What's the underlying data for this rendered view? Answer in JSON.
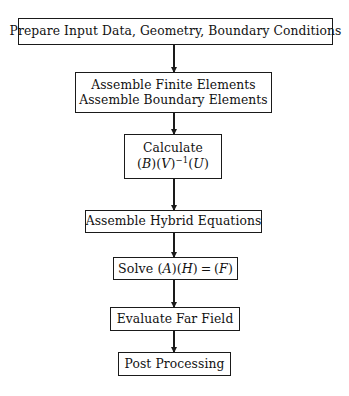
{
  "diagram": {
    "type": "flowchart",
    "orientation": "top-to-bottom",
    "background_color": "#ffffff",
    "line_color": "#1a1a1a",
    "nodes": [
      {
        "id": "prepare",
        "shape": "rectangle",
        "lines": [
          "Prepare Input Data, Geometry, Boundary Conditions"
        ]
      },
      {
        "id": "assemble-elements",
        "shape": "rectangle",
        "lines": [
          "Assemble Finite Elements",
          "Assemble Boundary Elements"
        ]
      },
      {
        "id": "calculate",
        "shape": "rectangle",
        "lines": [
          "Calculate"
        ],
        "formula": {
          "text": "(B)(V)^-1(U)",
          "parts": [
            {
              "kind": "paren",
              "text": "("
            },
            {
              "kind": "var",
              "text": "B"
            },
            {
              "kind": "paren",
              "text": ")("
            },
            {
              "kind": "var",
              "text": "V"
            },
            {
              "kind": "paren",
              "text": ")"
            },
            {
              "kind": "sup",
              "text": "−1"
            },
            {
              "kind": "paren",
              "text": "("
            },
            {
              "kind": "var",
              "text": "U"
            },
            {
              "kind": "paren",
              "text": ")"
            }
          ]
        }
      },
      {
        "id": "hybrid",
        "shape": "rectangle",
        "lines": [
          "Assemble Hybrid Equations"
        ]
      },
      {
        "id": "solve",
        "shape": "rectangle",
        "lines": [
          "Solve"
        ],
        "formula": {
          "text": "Solve (A)(H) = (F)",
          "label": "Solve",
          "parts": [
            {
              "kind": "paren",
              "text": "("
            },
            {
              "kind": "var",
              "text": "A"
            },
            {
              "kind": "paren",
              "text": ")("
            },
            {
              "kind": "var",
              "text": "H"
            },
            {
              "kind": "paren",
              "text": ")"
            },
            {
              "kind": "rel",
              "text": "="
            },
            {
              "kind": "paren",
              "text": "("
            },
            {
              "kind": "var",
              "text": "F"
            },
            {
              "kind": "paren",
              "text": ")"
            }
          ]
        }
      },
      {
        "id": "farfield",
        "shape": "rectangle",
        "lines": [
          "Evaluate Far Field"
        ]
      },
      {
        "id": "post",
        "shape": "rectangle",
        "lines": [
          "Post Processing"
        ]
      }
    ],
    "edges": [
      {
        "from": "prepare",
        "to": "assemble-elements",
        "style": "solid-arrow-down"
      },
      {
        "from": "assemble-elements",
        "to": "calculate",
        "style": "solid-arrow-down"
      },
      {
        "from": "calculate",
        "to": "hybrid",
        "style": "solid-arrow-down"
      },
      {
        "from": "hybrid",
        "to": "solve",
        "style": "solid-arrow-down"
      },
      {
        "from": "solve",
        "to": "farfield",
        "style": "solid-arrow-down"
      },
      {
        "from": "farfield",
        "to": "post",
        "style": "solid-arrow-down"
      }
    ],
    "text": {
      "prepare_line1": "Prepare Input Data, Geometry, Boundary Conditions",
      "assemble_line1": "Assemble Finite Elements",
      "assemble_line2": "Assemble Boundary Elements",
      "calculate_line1": "Calculate",
      "calculate_open_b": "(",
      "calculate_var_b": "B",
      "calculate_mid_bv": ")(",
      "calculate_var_v": "V",
      "calculate_close_v": ")",
      "calculate_sup": "−1",
      "calculate_open_u": "(",
      "calculate_var_u": "U",
      "calculate_close_u": ")",
      "hybrid_line1": "Assemble Hybrid Equations",
      "solve_label": "Solve",
      "solve_open_a": "(",
      "solve_var_a": "A",
      "solve_mid_ah": ")(",
      "solve_var_h": "H",
      "solve_close_h": ")",
      "solve_equals": "=",
      "solve_open_f": "(",
      "solve_var_f": "F",
      "solve_close_f": ")",
      "farfield_line1": "Evaluate Far Field",
      "post_line1": "Post Processing"
    }
  }
}
